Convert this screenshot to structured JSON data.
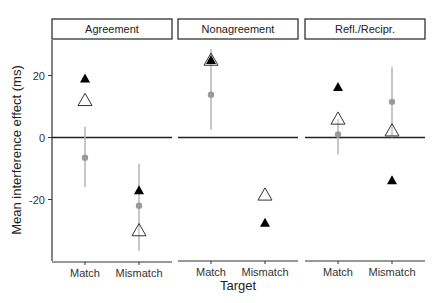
{
  "chart_data": {
    "type": "scatter",
    "title": "",
    "xlabel": "Target",
    "ylabel": "Mean interference effect (ms)",
    "ylim": [
      -39,
      34
    ],
    "yticks": [
      20,
      0,
      -20
    ],
    "categories": [
      "Match",
      "Mismatch"
    ],
    "panels": [
      {
        "name": "Agreement",
        "points": [
          {
            "category": "Match",
            "filled_triangle": 19,
            "open_triangle": 12,
            "gray_dot": -6.5,
            "error_low": -16,
            "error_high": 3.5
          },
          {
            "category": "Mismatch",
            "filled_triangle": -17,
            "open_triangle": -30,
            "gray_dot": -22,
            "error_low": -36.5,
            "error_high": -8.5
          }
        ]
      },
      {
        "name": "Nonagreement",
        "points": [
          {
            "category": "Match",
            "filled_triangle": 25,
            "open_triangle": 25,
            "gray_dot": 13.8,
            "error_low": 2.5,
            "error_high": 28.5
          },
          {
            "category": "Mismatch",
            "filled_triangle": -27.5,
            "open_triangle": -18.5,
            "gray_dot": null,
            "error_low": null,
            "error_high": null
          }
        ]
      },
      {
        "name": "Refl./Recipr.",
        "points": [
          {
            "category": "Match",
            "filled_triangle": 16.3,
            "open_triangle": 6,
            "gray_dot": 1,
            "error_low": -5.5,
            "error_high": 6
          },
          {
            "category": "Mismatch",
            "filled_triangle": -13.8,
            "open_triangle": 2.2,
            "gray_dot": 11.5,
            "error_low": 0,
            "error_high": 22.7
          }
        ]
      }
    ],
    "series_legend": [
      {
        "marker": "filled-triangle",
        "color": "#000000"
      },
      {
        "marker": "open-triangle",
        "color": "#ffffff",
        "stroke": "#333333"
      },
      {
        "marker": "gray-dot-with-error-bar",
        "color": "#9a9a9a"
      }
    ],
    "reference_line": 0,
    "grid": false,
    "legend_position": "none"
  }
}
